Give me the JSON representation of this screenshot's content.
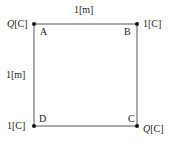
{
  "diagram": {
    "type": "square-charge-arrangement",
    "side_label_top": "1[m]",
    "side_label_left": "1[m]",
    "colors": {
      "line": "#555555",
      "dot": "#111111",
      "text": "#222222"
    },
    "corners": [
      {
        "name": "A",
        "position": "top-left",
        "charge_symbol": "Q",
        "charge_unit": "[C]"
      },
      {
        "name": "B",
        "position": "top-right",
        "charge_symbol": "1",
        "charge_unit": "[C]"
      },
      {
        "name": "C",
        "position": "bottom-right",
        "charge_symbol": "Q",
        "charge_unit": "[C]"
      },
      {
        "name": "D",
        "position": "bottom-left",
        "charge_symbol": "1",
        "charge_unit": "[C]"
      }
    ]
  }
}
